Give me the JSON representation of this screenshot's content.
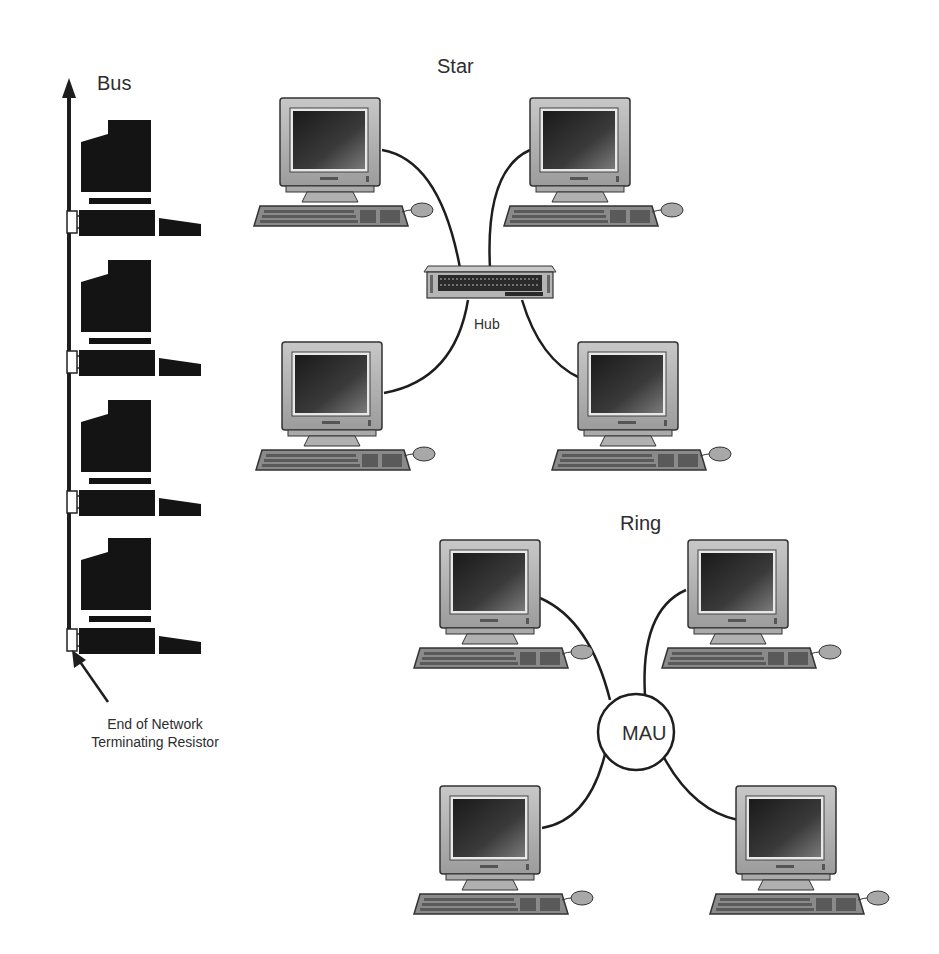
{
  "diagram": {
    "type": "network-topologies",
    "sections": {
      "bus": {
        "title": "Bus",
        "nodes": 4,
        "caption_line1": "End of Network",
        "caption_line2": "Terminating Resistor"
      },
      "star": {
        "title": "Star",
        "center_label": "Hub",
        "nodes": 4
      },
      "ring": {
        "title": "Ring",
        "center_label": "MAU",
        "nodes": 4
      }
    },
    "colors": {
      "background": "#ffffff",
      "line": "#1e1e1e",
      "silhouette": "#111111",
      "monitor_body": "#b9b9b9",
      "screen": "#2a2a2a",
      "text": "#2e2e2e"
    }
  }
}
